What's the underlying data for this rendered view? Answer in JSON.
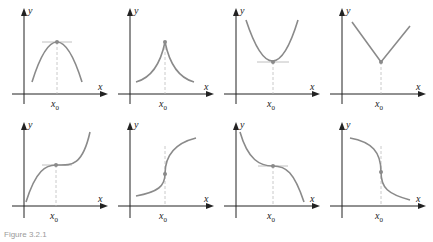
{
  "figure": {
    "caption": "Figure 3.2.1",
    "axis_labels": {
      "x": "x",
      "y": "y",
      "point": "x",
      "point_sub": "0"
    },
    "colors": {
      "curve": "#8a8a8a",
      "axis": "#222222",
      "tangent": "#b0b0b0",
      "guide": "#bdbdbd",
      "point": "#8a8a8a"
    },
    "panels": [
      {
        "id": "local-max-smooth",
        "row": 1,
        "col": 1,
        "description": "smooth maximum with horizontal tangent at x0"
      },
      {
        "id": "cusp-max",
        "row": 1,
        "col": 2,
        "description": "cusp maximum at x0"
      },
      {
        "id": "local-min-smooth",
        "row": 1,
        "col": 3,
        "description": "smooth minimum with horizontal tangent at x0"
      },
      {
        "id": "corner-min",
        "row": 1,
        "col": 4,
        "description": "corner (V-shape) minimum at x0"
      },
      {
        "id": "increasing-horizontal-inflection",
        "row": 2,
        "col": 1,
        "description": "increasing curve with horizontal tangent inflection at x0"
      },
      {
        "id": "increasing-vertical-tangent",
        "row": 2,
        "col": 2,
        "description": "increasing curve with vertical tangent at x0"
      },
      {
        "id": "decreasing-horizontal-inflection",
        "row": 2,
        "col": 3,
        "description": "decreasing curve with horizontal tangent inflection at x0"
      },
      {
        "id": "decreasing-vertical-tangent",
        "row": 2,
        "col": 4,
        "description": "decreasing curve with vertical tangent at x0"
      }
    ]
  }
}
